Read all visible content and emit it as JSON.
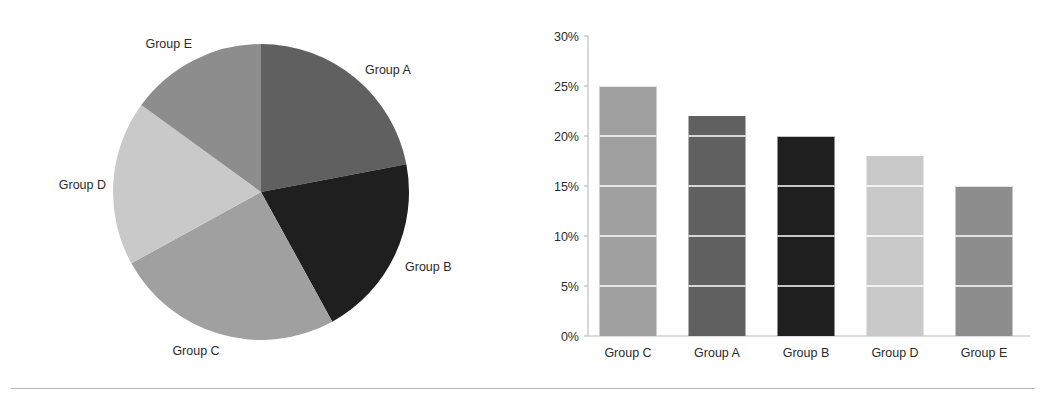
{
  "chart_data": [
    {
      "type": "pie",
      "title": "",
      "labels": [
        "Group A",
        "Group B",
        "Group C",
        "Group D",
        "Group E"
      ],
      "values": [
        22,
        20,
        25,
        18,
        15
      ],
      "unit": "%",
      "start_angle_deg": 90,
      "direction": "clockwise",
      "colors": [
        "#606060",
        "#1f1f1f",
        "#a0a0a0",
        "#c9c9c9",
        "#8d8d8d"
      ],
      "labels_position": "outside",
      "legend": "none",
      "grid": false,
      "slice_labels": [
        {
          "name": "Group A",
          "value": 22,
          "color": "#606060",
          "label_x": 365,
          "label_y": 74,
          "anchor": "start"
        },
        {
          "name": "Group B",
          "value": 20,
          "color": "#1f1f1f",
          "label_x": 405,
          "label_y": 271,
          "anchor": "start"
        },
        {
          "name": "Group C",
          "value": 25,
          "color": "#a0a0a0",
          "label_x": 196,
          "label_y": 355,
          "anchor": "middle"
        },
        {
          "name": "Group D",
          "value": 18,
          "color": "#c9c9c9",
          "label_x": 106,
          "label_y": 189,
          "anchor": "end"
        },
        {
          "name": "Group E",
          "value": 15,
          "color": "#8d8d8d",
          "label_x": 192,
          "label_y": 48,
          "anchor": "end"
        }
      ],
      "geometry": {
        "cx": 261,
        "cy": 192,
        "r": 148
      }
    },
    {
      "type": "bar",
      "title": "",
      "xlabel": "",
      "ylabel": "",
      "categories": [
        "Group C",
        "Group A",
        "Group B",
        "Group D",
        "Group E"
      ],
      "values": [
        25,
        22,
        20,
        18,
        15
      ],
      "unit": "%",
      "ylim": [
        0,
        30
      ],
      "ytick_values": [
        0,
        5,
        10,
        15,
        20,
        25,
        30
      ],
      "ytick_labels": [
        "0%",
        "5%",
        "10%",
        "15%",
        "20%",
        "25%",
        "30%"
      ],
      "grid": true,
      "grid_color": "#ffffff",
      "legend": "none",
      "colors": [
        "#a0a0a0",
        "#606060",
        "#1f1f1f",
        "#c9c9c9",
        "#8d8d8d"
      ],
      "bars": [
        {
          "name": "Group C",
          "value": 25,
          "color": "#a0a0a0"
        },
        {
          "name": "Group A",
          "value": 22,
          "color": "#606060"
        },
        {
          "name": "Group B",
          "value": 20,
          "color": "#1f1f1f"
        },
        {
          "name": "Group D",
          "value": 18,
          "color": "#c9c9c9"
        },
        {
          "name": "Group E",
          "value": 15,
          "color": "#8d8d8d"
        }
      ],
      "plot_geometry": {
        "axis_x": 88,
        "y_zero": 336,
        "y_top": 36,
        "bar_width": 57,
        "bar_centers": [
          128,
          217,
          306,
          395,
          484
        ]
      }
    }
  ]
}
